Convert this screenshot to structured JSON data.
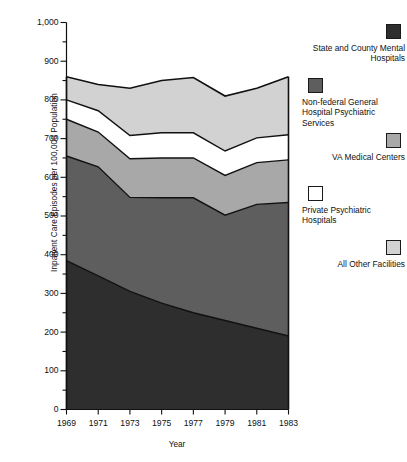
{
  "chart_data": {
    "type": "area",
    "stacked": true,
    "title": "",
    "xlabel": "Year",
    "ylabel": "Inpatient Care Episodes per 100,000 Population",
    "x": [
      1969,
      1971,
      1973,
      1975,
      1977,
      1979,
      1981,
      1983
    ],
    "xlim": [
      1969,
      1983
    ],
    "ylim": [
      0,
      1000
    ],
    "x_tick_labels": [
      "1969",
      "1971",
      "1973",
      "1975",
      "1977",
      "1979",
      "1981",
      "1983"
    ],
    "y_tick_labels": [
      "0",
      "100",
      "200",
      "300",
      "400",
      "500",
      "600",
      "700",
      "800",
      "900",
      "1,000"
    ],
    "y_ticks": [
      0,
      100,
      200,
      300,
      400,
      500,
      600,
      700,
      800,
      900,
      1000
    ],
    "y_minor_tick_interval": 50,
    "grid": false,
    "legend_position": "right",
    "series": [
      {
        "name": "State and County Mental Hospitals",
        "color": "#2e2e2e",
        "order": 1,
        "values": [
          385,
          345,
          305,
          275,
          250,
          230,
          210,
          190
        ]
      },
      {
        "name": "Non-federal General Hospital Psychiatric Services",
        "color": "#5e5e5e",
        "order": 2,
        "values": [
          270,
          282,
          243,
          272,
          297,
          272,
          320,
          345
        ]
      },
      {
        "name": "VA Medical Centers",
        "color": "#a8a8a8",
        "order": 3,
        "values": [
          95,
          90,
          100,
          103,
          103,
          103,
          108,
          110
        ]
      },
      {
        "name": "Private Psychiatric Hospitals",
        "color": "#ffffff",
        "order": 4,
        "values": [
          50,
          55,
          60,
          65,
          65,
          63,
          64,
          65
        ]
      },
      {
        "name": "All Other Facilities",
        "color": "#d2d2d2",
        "order": 5,
        "values": [
          60,
          68,
          122,
          135,
          143,
          142,
          128,
          150
        ]
      }
    ],
    "cumulative_boundaries": {
      "state_county_top": [
        385,
        345,
        305,
        275,
        250,
        230,
        210,
        190
      ],
      "nonfederal_top": [
        655,
        627,
        548,
        547,
        547,
        502,
        530,
        535
      ],
      "va_top": [
        750,
        717,
        648,
        650,
        650,
        605,
        638,
        645
      ],
      "private_top": [
        800,
        772,
        708,
        715,
        715,
        668,
        702,
        710
      ],
      "total_top": [
        860,
        840,
        830,
        850,
        858,
        810,
        830,
        860
      ]
    }
  },
  "legend": {
    "items": [
      {
        "label": "State and County Mental Hospitals",
        "color": "#2e2e2e",
        "align": "right"
      },
      {
        "label": "Non-federal General Hospital Psychiatric Services",
        "color": "#5e5e5e",
        "align": "left"
      },
      {
        "label": "VA Medical Centers",
        "color": "#a8a8a8",
        "align": "right"
      },
      {
        "label": "Private Psychiatric Hospitals",
        "color": "#ffffff",
        "align": "left"
      },
      {
        "label": "All Other Facilities",
        "color": "#d2d2d2",
        "align": "right"
      }
    ]
  },
  "axes": {
    "y_title": "Inpatient Care Episodes per 100,000 Population",
    "x_title": "Year",
    "y_labels": [
      "1,000",
      "900",
      "800",
      "700",
      "600",
      "500",
      "400",
      "300",
      "200",
      "100",
      "0"
    ],
    "x_labels": [
      "1969",
      "1971",
      "1973",
      "1975",
      "1977",
      "1979",
      "1981",
      "1983"
    ]
  }
}
